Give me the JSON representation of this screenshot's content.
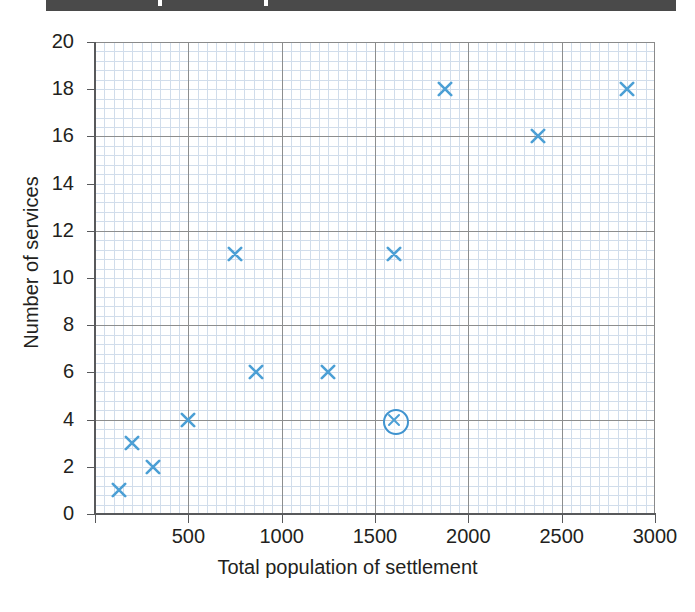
{
  "scan_bar": {
    "present": true
  },
  "chart_data": {
    "type": "scatter",
    "title": "",
    "xlabel": "Total population of settlement",
    "ylabel": "Number of services",
    "xlim": [
      0,
      3000
    ],
    "ylim": [
      0,
      20
    ],
    "x_ticks": [
      0,
      500,
      1000,
      1500,
      2000,
      2500,
      3000
    ],
    "x_tick_labels": [
      "",
      "500",
      "1000",
      "1500",
      "2000",
      "2500",
      "3000"
    ],
    "y_ticks": [
      0,
      2,
      4,
      6,
      8,
      10,
      12,
      14,
      16,
      18,
      20
    ],
    "y_tick_labels": [
      "0",
      "2",
      "4",
      "6",
      "8",
      "10",
      "12",
      "14",
      "16",
      "18",
      "20"
    ],
    "grid": "graph-paper minor 50x0.4 with major 500x2",
    "legend": null,
    "marker": "x",
    "marker_color": "#4b9fd5",
    "points": [
      {
        "x": 130,
        "y": 1,
        "highlighted": false
      },
      {
        "x": 200,
        "y": 3,
        "highlighted": false
      },
      {
        "x": 310,
        "y": 2,
        "highlighted": false
      },
      {
        "x": 500,
        "y": 4,
        "highlighted": false
      },
      {
        "x": 750,
        "y": 11,
        "highlighted": false
      },
      {
        "x": 865,
        "y": 6,
        "highlighted": false
      },
      {
        "x": 1250,
        "y": 6,
        "highlighted": false
      },
      {
        "x": 1600,
        "y": 11,
        "highlighted": false
      },
      {
        "x": 1600,
        "y": 4,
        "highlighted": true
      },
      {
        "x": 1875,
        "y": 18,
        "highlighted": false
      },
      {
        "x": 2375,
        "y": 16,
        "highlighted": false
      },
      {
        "x": 2850,
        "y": 18,
        "highlighted": false
      }
    ]
  }
}
